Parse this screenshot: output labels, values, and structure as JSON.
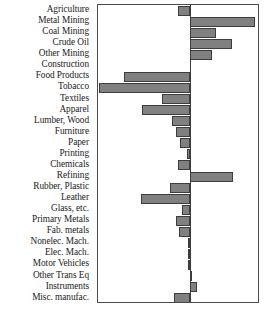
{
  "chart_data": {
    "type": "bar",
    "orientation": "horizontal",
    "title": "",
    "xlabel": "",
    "ylabel": "",
    "grid": false,
    "legend": null,
    "zero_reference_line": true,
    "xlim": [
      -0.6,
      0.45
    ],
    "categories": [
      "Agriculture",
      "Metal Mining",
      "Coal Mining",
      "Crude Oil",
      "Other Mining",
      "Construction",
      "Food Products",
      "Tobacco",
      "Textiles",
      "Apparel",
      "Lumber, Wood",
      "Furniture",
      "Paper",
      "Printing",
      "Chemicals",
      "Refining",
      "Rubber, Plastic",
      "Leather",
      "Glass, etc.",
      "Primary Metals",
      "Fab. metals",
      "Nonelec. Mach.",
      "Elec. Mach.",
      "Motor Vehicles",
      "Other Trans Eq",
      "Instruments",
      "Misc. manufac."
    ],
    "values": [
      -0.08,
      0.43,
      0.172,
      0.278,
      0.146,
      0.0,
      -0.43,
      -0.596,
      -0.185,
      -0.311,
      -0.119,
      -0.093,
      -0.066,
      -0.02,
      -0.08,
      0.285,
      -0.132,
      -0.318,
      -0.053,
      -0.093,
      -0.073,
      -0.013,
      -0.013,
      -0.013,
      0.013,
      0.046,
      -0.106
    ]
  },
  "style": {
    "bar_fill": "#808080",
    "bar_edge": "#3d3d3d",
    "axis_color": "#4a4a4a",
    "label_color": "#1a1a1a",
    "background": "#ffffff"
  }
}
